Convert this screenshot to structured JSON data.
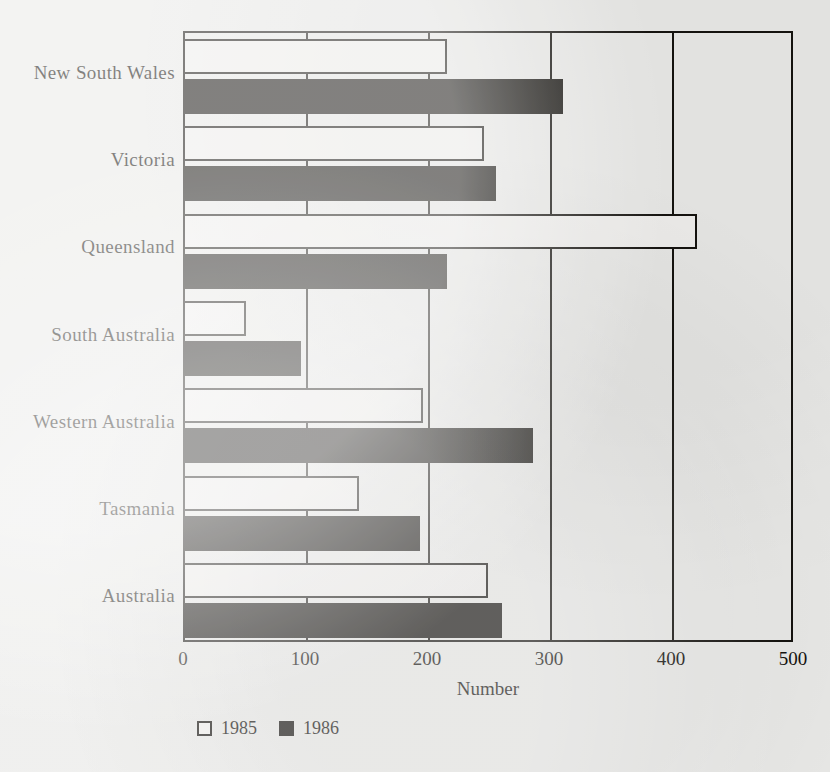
{
  "chart_data": {
    "type": "bar",
    "orientation": "horizontal",
    "title": "",
    "xlabel": "Number",
    "ylabel": "",
    "xlim": [
      0,
      500
    ],
    "xticks": [
      0,
      100,
      200,
      300,
      400,
      500
    ],
    "xtick_labels": [
      "0",
      "100",
      "200",
      "300",
      "400",
      "500"
    ],
    "grid": true,
    "grid_axis": "x",
    "legend_position": "bottom-left",
    "categories": [
      "New South Wales",
      "Victoria",
      "Queensland",
      "South Australia",
      "Western Australia",
      "Tasmania",
      "Australia"
    ],
    "series": [
      {
        "name": "1985",
        "fill": "#f0efed",
        "edge": "#15130f",
        "values": [
          215,
          245,
          420,
          50,
          195,
          143,
          248
        ]
      },
      {
        "name": "1986",
        "fill": "#15130f",
        "edge": "#15130f",
        "values": [
          310,
          255,
          215,
          95,
          285,
          193,
          260
        ]
      }
    ]
  },
  "axis": {
    "x_title": "Number",
    "tick_labels": [
      "0",
      "100",
      "200",
      "300",
      "400",
      "500"
    ]
  },
  "legend": {
    "entries": [
      {
        "label": "1985",
        "style": "fill-open"
      },
      {
        "label": "1986",
        "style": "fill-solid"
      }
    ]
  }
}
